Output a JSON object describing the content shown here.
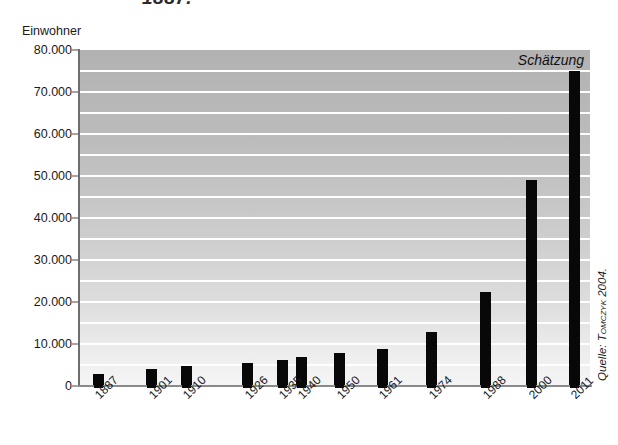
{
  "title_fragment": "1887.",
  "y_axis_caption": "Einwohner",
  "annotation": "Schätzung",
  "source": {
    "prefix": "Quelle: ",
    "author": "Tomczyk",
    "suffix": " 2004."
  },
  "chart_data": {
    "type": "bar",
    "title": "",
    "xlabel": "",
    "ylabel": "Einwohner",
    "categories": [
      "1887",
      "1901",
      "1910",
      "1926",
      "1935",
      "1940",
      "1950",
      "1961",
      "1974",
      "1988",
      "2000",
      "2011"
    ],
    "values": [
      2800,
      4000,
      4700,
      5500,
      6200,
      6800,
      7800,
      8800,
      12800,
      22500,
      49000,
      75000
    ],
    "ylim": [
      0,
      80000
    ],
    "ytick_labels": [
      "0",
      "10.000",
      "20.000",
      "30.000",
      "40.000",
      "50.000",
      "60.000",
      "70.000",
      "80.000"
    ],
    "ytick_values": [
      0,
      10000,
      20000,
      30000,
      40000,
      50000,
      60000,
      70000,
      80000
    ],
    "gridline_interval": 5000,
    "grid": true,
    "legend": "none",
    "annotations": [
      {
        "text": "Schätzung",
        "position": "top-right",
        "refers_to": "2011"
      }
    ],
    "bar_color": "#080808",
    "plot_background": "#c2c2c2",
    "gridline_color": "#ffffff"
  }
}
